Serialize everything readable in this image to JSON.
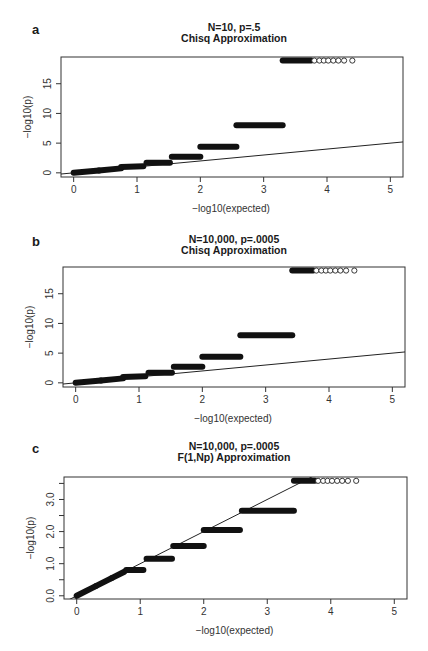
{
  "chart_data": [
    {
      "panel": "a",
      "type": "scatter",
      "title": "N=10, p=.5",
      "subtitle": "Chisq Approximation",
      "xlabel": "-log10(expected)",
      "ylabel": "-log10(p)",
      "xticks": [
        0,
        1,
        2,
        3,
        4,
        5
      ],
      "yticks": [
        0,
        5,
        10,
        15
      ],
      "xlim": [
        -0.2,
        5.2
      ],
      "ylim": [
        -0.7,
        19.5
      ],
      "reference_line": {
        "slope": 1,
        "intercept": 0
      },
      "steps": [
        {
          "x0": 0.0,
          "x1": 0.4,
          "y0": 0.0,
          "y1": 0.4
        },
        {
          "x0": 0.4,
          "x1": 0.75,
          "y0": 0.4,
          "y1": 0.75
        },
        {
          "x0": 0.75,
          "x1": 1.1,
          "y0": 1.0,
          "y1": 1.1
        },
        {
          "x0": 1.15,
          "x1": 1.52,
          "y0": 1.7,
          "y1": 1.7
        },
        {
          "x0": 1.55,
          "x1": 2.0,
          "y0": 2.7,
          "y1": 2.7
        },
        {
          "x0": 2.0,
          "x1": 2.57,
          "y0": 4.4,
          "y1": 4.4
        },
        {
          "x0": 2.57,
          "x1": 3.3,
          "y0": 8.0,
          "y1": 8.0
        },
        {
          "x0": 3.3,
          "x1": 3.75,
          "y0": 18.9,
          "y1": 18.9
        }
      ],
      "open_points": [
        {
          "x": 3.8,
          "y": 18.9
        },
        {
          "x": 3.88,
          "y": 18.9
        },
        {
          "x": 3.95,
          "y": 18.9
        },
        {
          "x": 4.02,
          "y": 18.9
        },
        {
          "x": 4.1,
          "y": 18.9
        },
        {
          "x": 4.18,
          "y": 18.9
        },
        {
          "x": 4.27,
          "y": 18.9
        },
        {
          "x": 4.4,
          "y": 18.9
        }
      ]
    },
    {
      "panel": "b",
      "type": "scatter",
      "title": "N=10,000, p=.0005",
      "subtitle": "Chisq Approximation",
      "xlabel": "-log10(expected)",
      "ylabel": "-log10(p)",
      "xticks": [
        0,
        1,
        2,
        3,
        4,
        5
      ],
      "yticks": [
        0,
        5,
        10,
        15
      ],
      "xlim": [
        -0.2,
        5.2
      ],
      "ylim": [
        -0.7,
        19.5
      ],
      "reference_line": {
        "slope": 1,
        "intercept": 0
      },
      "steps": [
        {
          "x0": 0.0,
          "x1": 0.4,
          "y0": 0.0,
          "y1": 0.4
        },
        {
          "x0": 0.4,
          "x1": 0.75,
          "y0": 0.4,
          "y1": 0.75
        },
        {
          "x0": 0.75,
          "x1": 1.1,
          "y0": 1.0,
          "y1": 1.1
        },
        {
          "x0": 1.15,
          "x1": 1.52,
          "y0": 1.7,
          "y1": 1.7
        },
        {
          "x0": 1.55,
          "x1": 2.0,
          "y0": 2.7,
          "y1": 2.7
        },
        {
          "x0": 2.0,
          "x1": 2.6,
          "y0": 4.4,
          "y1": 4.4
        },
        {
          "x0": 2.6,
          "x1": 3.42,
          "y0": 8.0,
          "y1": 8.0
        },
        {
          "x0": 3.42,
          "x1": 3.75,
          "y0": 18.9,
          "y1": 18.9
        }
      ],
      "open_points": [
        {
          "x": 3.8,
          "y": 18.9
        },
        {
          "x": 3.88,
          "y": 18.9
        },
        {
          "x": 3.95,
          "y": 18.9
        },
        {
          "x": 4.02,
          "y": 18.9
        },
        {
          "x": 4.1,
          "y": 18.9
        },
        {
          "x": 4.18,
          "y": 18.9
        },
        {
          "x": 4.27,
          "y": 18.9
        },
        {
          "x": 4.4,
          "y": 18.9
        }
      ]
    },
    {
      "panel": "c",
      "type": "scatter",
      "title": "N=10,000, p=.0005",
      "subtitle": "F(1,Np) Approximation",
      "xlabel": "-log10(expected)",
      "ylabel": "-log10(p)",
      "xticks": [
        0,
        1,
        2,
        3,
        4,
        5
      ],
      "yticks": [
        0.0,
        0.5,
        1.0,
        1.5,
        2.0,
        2.5,
        3.0,
        3.5
      ],
      "ytick_labels": [
        "0.0",
        "",
        "1.0",
        "",
        "2.0",
        "",
        "3.0",
        ""
      ],
      "xlim": [
        -0.2,
        5.2
      ],
      "ylim": [
        -0.1,
        3.7
      ],
      "reference_line": {
        "slope": 1,
        "intercept": 0
      },
      "steps": [
        {
          "x0": 0.0,
          "x1": 0.3,
          "y0": 0.0,
          "y1": 0.3
        },
        {
          "x0": 0.3,
          "x1": 0.55,
          "y0": 0.3,
          "y1": 0.55
        },
        {
          "x0": 0.55,
          "x1": 0.75,
          "y0": 0.55,
          "y1": 0.75
        },
        {
          "x0": 0.78,
          "x1": 1.05,
          "y0": 0.8,
          "y1": 0.8
        },
        {
          "x0": 1.1,
          "x1": 1.5,
          "y0": 1.15,
          "y1": 1.15
        },
        {
          "x0": 1.52,
          "x1": 2.0,
          "y0": 1.55,
          "y1": 1.55
        },
        {
          "x0": 2.0,
          "x1": 2.57,
          "y0": 2.05,
          "y1": 2.05
        },
        {
          "x0": 2.6,
          "x1": 3.42,
          "y0": 2.65,
          "y1": 2.65
        },
        {
          "x0": 3.42,
          "x1": 3.75,
          "y0": 3.58,
          "y1": 3.58
        }
      ],
      "open_points": [
        {
          "x": 3.8,
          "y": 3.58
        },
        {
          "x": 3.88,
          "y": 3.58
        },
        {
          "x": 3.95,
          "y": 3.58
        },
        {
          "x": 4.02,
          "y": 3.58
        },
        {
          "x": 4.1,
          "y": 3.58
        },
        {
          "x": 4.18,
          "y": 3.58
        },
        {
          "x": 4.27,
          "y": 3.58
        },
        {
          "x": 4.4,
          "y": 3.58
        }
      ]
    }
  ],
  "panels": [
    {
      "letter": "a",
      "title": "N=10, p=.5",
      "subtitle": "Chisq Approximation",
      "xlabel": "-log10(expected)",
      "ylabel": "-log10(p)"
    },
    {
      "letter": "b",
      "title": "N=10,000, p=.0005",
      "subtitle": "Chisq Approximation",
      "xlabel": "-log10(expected)",
      "ylabel": "-log10(p)"
    },
    {
      "letter": "c",
      "title": "N=10,000, p=.0005",
      "subtitle": "F(1,Np) Approximation",
      "xlabel": "-log10(expected)",
      "ylabel": "-log10(p)"
    }
  ]
}
